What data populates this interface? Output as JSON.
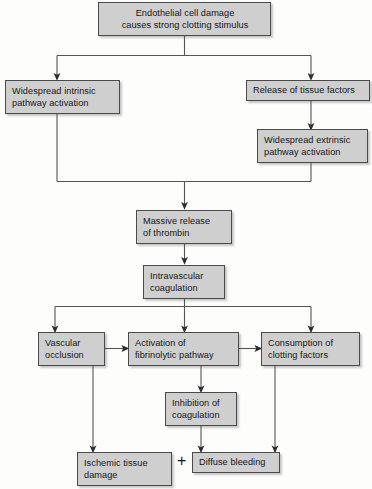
{
  "diagram": {
    "palette": {
      "box_fill": "#cfcfcf",
      "box_border": "#4a4a4a",
      "line": "#555555",
      "text": "#151515",
      "background": "#fdfdfc"
    },
    "operator": {
      "plus_symbol": "+"
    },
    "nodes": [
      {
        "id": "endothelial-cell-damage",
        "line1": "Endothelial cell damage",
        "line2": "causes strong clotting stimulus"
      },
      {
        "id": "widespread-intrinsic-pathway-activation",
        "line1": "Widespread intrinsic",
        "line2": "pathway activation"
      },
      {
        "id": "release-of-tissue-factors",
        "line1": "Release of tissue factors",
        "line2": ""
      },
      {
        "id": "widespread-extrinsic-pathway-activation",
        "line1": "Widespread extrinsic",
        "line2": "pathway activation"
      },
      {
        "id": "massive-release-of-thrombin",
        "line1": "Massive release",
        "line2": "of thrombin"
      },
      {
        "id": "intravascular-coagulation",
        "line1": "Intravascular",
        "line2": "coagulation"
      },
      {
        "id": "vascular-occlusion",
        "line1": "Vascular",
        "line2": "occlusion"
      },
      {
        "id": "activation-of-fibrinolytic-pathway",
        "line1": "Activation of",
        "line2": "fibrinolytic pathway"
      },
      {
        "id": "consumption-of-clotting-factors",
        "line1": "Consumption of",
        "line2": "clotting factors"
      },
      {
        "id": "inhibition-of-coagulation",
        "line1": "Inhibition of",
        "line2": "coagulation"
      },
      {
        "id": "ischemic-tissue-damage",
        "line1": "Ischemic tissue",
        "line2": "damage"
      },
      {
        "id": "diffuse-bleeding",
        "line1": "Diffuse bleeding",
        "line2": ""
      }
    ],
    "edges": [
      {
        "from": "endothelial-cell-damage",
        "to": "widespread-intrinsic-pathway-activation"
      },
      {
        "from": "endothelial-cell-damage",
        "to": "release-of-tissue-factors"
      },
      {
        "from": "release-of-tissue-factors",
        "to": "widespread-extrinsic-pathway-activation"
      },
      {
        "from": "widespread-intrinsic-pathway-activation",
        "to": "massive-release-of-thrombin"
      },
      {
        "from": "widespread-extrinsic-pathway-activation",
        "to": "massive-release-of-thrombin"
      },
      {
        "from": "massive-release-of-thrombin",
        "to": "intravascular-coagulation"
      },
      {
        "from": "intravascular-coagulation",
        "to": "vascular-occlusion"
      },
      {
        "from": "intravascular-coagulation",
        "to": "activation-of-fibrinolytic-pathway"
      },
      {
        "from": "intravascular-coagulation",
        "to": "consumption-of-clotting-factors"
      },
      {
        "from": "vascular-occlusion",
        "to": "activation-of-fibrinolytic-pathway"
      },
      {
        "from": "activation-of-fibrinolytic-pathway",
        "to": "consumption-of-clotting-factors"
      },
      {
        "from": "activation-of-fibrinolytic-pathway",
        "to": "inhibition-of-coagulation"
      },
      {
        "from": "vascular-occlusion",
        "to": "ischemic-tissue-damage"
      },
      {
        "from": "inhibition-of-coagulation",
        "to": "diffuse-bleeding"
      },
      {
        "from": "consumption-of-clotting-factors",
        "to": "diffuse-bleeding"
      }
    ]
  }
}
